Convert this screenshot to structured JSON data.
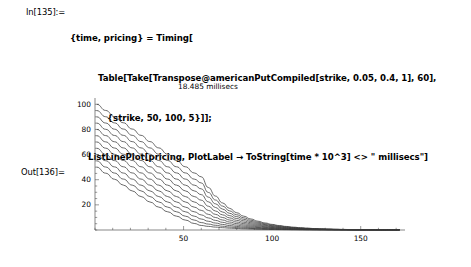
{
  "notebook": {
    "input": {
      "label": "In[135]:=",
      "lines": [
        "{time, pricing} = Timing[",
        "Table[Take[Transpose@americanPutCompiled[strike, 0.05, 0.4, 1], 60],",
        "{strike, 50, 100, 5}]];",
        "ListLinePlot[pricing, PlotLabel → ToString[time * 10^3] <> \" millisecs\"]"
      ]
    },
    "output": {
      "label": "Out[136]="
    }
  },
  "chart_data": {
    "type": "line",
    "title": "18.485 millisecs",
    "xlabel": "",
    "ylabel": "",
    "xlim": [
      0,
      175
    ],
    "ylim": [
      0,
      105
    ],
    "xticks": [
      50,
      100,
      150
    ],
    "yticks": [
      20,
      40,
      60,
      80,
      100
    ],
    "grid": false,
    "legend": "none",
    "x": [
      1,
      6,
      11,
      16,
      21,
      26,
      31,
      36,
      41,
      46,
      51,
      56,
      60
    ],
    "series": [
      {
        "name": "strike 50",
        "values": [
          50.0,
          45.2,
          40.4,
          35.7,
          31.1,
          26.6,
          22.3,
          18.2,
          14.5,
          11.0,
          7.9,
          5.2,
          3.6
        ]
      },
      {
        "name": "strike 55",
        "values": [
          55.0,
          50.1,
          45.3,
          40.5,
          35.7,
          31.1,
          26.6,
          22.3,
          18.2,
          14.5,
          11.0,
          7.9,
          5.9
        ]
      },
      {
        "name": "strike 60",
        "values": [
          60.0,
          55.1,
          50.2,
          45.3,
          40.5,
          35.7,
          31.1,
          26.6,
          22.3,
          18.2,
          14.5,
          11.0,
          8.7
        ]
      },
      {
        "name": "strike 65",
        "values": [
          65.0,
          60.1,
          55.2,
          50.3,
          45.4,
          40.5,
          35.7,
          31.1,
          26.6,
          22.3,
          18.2,
          14.5,
          12.0
        ]
      },
      {
        "name": "strike 70",
        "values": [
          70.0,
          65.1,
          60.2,
          55.3,
          50.3,
          45.4,
          40.5,
          35.7,
          31.1,
          26.6,
          22.3,
          18.2,
          15.6
        ]
      },
      {
        "name": "strike 75",
        "values": [
          75.0,
          70.1,
          65.2,
          60.3,
          55.3,
          50.3,
          45.4,
          40.5,
          35.7,
          31.1,
          26.6,
          22.3,
          19.5
        ]
      },
      {
        "name": "strike 80",
        "values": [
          80.0,
          75.1,
          70.2,
          65.3,
          60.3,
          55.3,
          50.3,
          45.4,
          40.5,
          35.7,
          31.1,
          26.6,
          23.7
        ]
      },
      {
        "name": "strike 85",
        "values": [
          85.0,
          80.1,
          75.2,
          70.3,
          65.3,
          60.3,
          55.3,
          50.3,
          45.4,
          40.5,
          35.7,
          31.1,
          28.1
        ]
      },
      {
        "name": "strike 90",
        "values": [
          90.0,
          85.1,
          80.2,
          75.3,
          70.3,
          65.3,
          60.3,
          55.3,
          50.3,
          45.4,
          40.5,
          35.7,
          32.7
        ]
      },
      {
        "name": "strike 95",
        "values": [
          95.0,
          90.1,
          85.2,
          80.3,
          75.3,
          70.3,
          65.3,
          60.3,
          55.3,
          50.3,
          45.4,
          40.5,
          37.4
        ]
      },
      {
        "name": "strike 100",
        "values": [
          100.0,
          95.1,
          90.2,
          85.3,
          80.3,
          75.3,
          70.3,
          65.3,
          60.3,
          55.3,
          50.3,
          45.4,
          42.3
        ]
      }
    ]
  }
}
